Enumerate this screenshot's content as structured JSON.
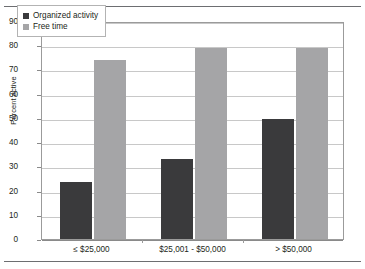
{
  "chart_data": {
    "type": "bar",
    "title": "",
    "subtitle": "",
    "xlabel": "",
    "ylabel": "Percent active",
    "ylim": [
      0,
      90
    ],
    "ytick_step": 10,
    "yticks": [
      90,
      80,
      70,
      60,
      50,
      40,
      30,
      20,
      10,
      0
    ],
    "ytick_labels": [
      "90",
      "80",
      "70",
      "60",
      "50",
      "40",
      "30",
      "20",
      "10",
      "0"
    ],
    "grid": true,
    "grid_axis": "y",
    "legend_position": "upper-left-inside",
    "categories": [
      "≤ $25,000",
      "$25,001 - $50,000",
      "> $50,000"
    ],
    "series": [
      {
        "name": "Organized activity",
        "color": "#3a3a3c",
        "values": [
          23.5,
          33.0,
          49.5
        ]
      },
      {
        "name": "Free time",
        "color": "#a5a5a7",
        "values": [
          74.0,
          79.0,
          79.0
        ]
      }
    ]
  },
  "legend": {
    "entries": [
      {
        "label": "Organized activity"
      },
      {
        "label": "Free time"
      }
    ]
  },
  "colors": {
    "series_organized": "#3a3a3c",
    "series_free_time": "#a5a5a7",
    "gridline": "#c8c8c8",
    "frame": "#9b9b9b",
    "rule": "#6d6e71",
    "text": "#231f20"
  }
}
